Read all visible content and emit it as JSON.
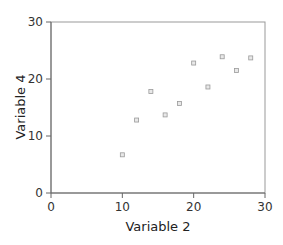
{
  "chart_data": {
    "type": "scatter",
    "title": "",
    "xlabel": "Variable 2",
    "ylabel": "Variable 4",
    "xlim": [
      0,
      30
    ],
    "ylim": [
      0,
      30
    ],
    "xticks": [
      0,
      10,
      20,
      30
    ],
    "yticks": [
      0,
      10,
      20,
      30
    ],
    "grid": false,
    "legend": null,
    "series": [
      {
        "name": "Variable 4 vs Variable 2",
        "marker": "square",
        "color": "#9a9a9a",
        "points": [
          {
            "x": 10,
            "y": 6.7
          },
          {
            "x": 12,
            "y": 12.8
          },
          {
            "x": 14,
            "y": 17.8
          },
          {
            "x": 16,
            "y": 13.7
          },
          {
            "x": 18,
            "y": 15.7
          },
          {
            "x": 20,
            "y": 22.8
          },
          {
            "x": 22,
            "y": 18.6
          },
          {
            "x": 24,
            "y": 23.9
          },
          {
            "x": 26,
            "y": 21.5
          },
          {
            "x": 28,
            "y": 23.7
          }
        ]
      }
    ]
  },
  "colors": {
    "axis": "#666666",
    "frame": "#999999",
    "marker": "#9a9a9a"
  }
}
